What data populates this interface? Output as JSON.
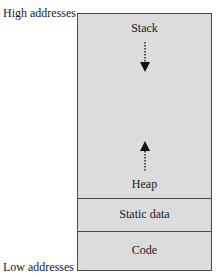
{
  "diagram": {
    "type": "memory-layout",
    "address_labels": {
      "high": "High addresses",
      "low": "Low addresses"
    },
    "segments": [
      {
        "name": "Stack",
        "growth": "down"
      },
      {
        "name": "Heap",
        "growth": "up"
      },
      {
        "name": "Static data"
      },
      {
        "name": "Code"
      }
    ],
    "colors": {
      "segment_fill": "#dcdcdc",
      "border": "#4a4a4a",
      "arrow": "#111111"
    }
  }
}
